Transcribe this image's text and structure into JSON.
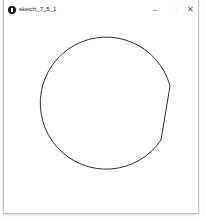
{
  "window": {
    "title": "sketch_7_5_1",
    "controls": {
      "minimize": "–",
      "maximize": "□",
      "close": "✕"
    }
  },
  "canvas": {
    "background": "#ffffff",
    "shape": {
      "type": "circle-with-point",
      "center": [
        104,
        107
      ],
      "radius": 66,
      "corner_point": [
        170,
        86
      ],
      "stroke": "#333333"
    }
  }
}
